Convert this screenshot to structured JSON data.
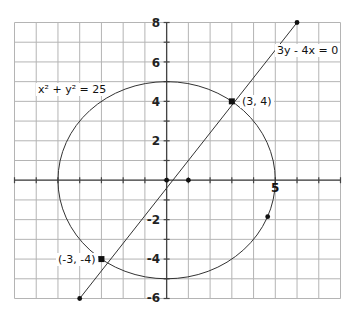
{
  "chart_data": {
    "type": "diagram",
    "title": "",
    "grid": true,
    "xlim": [
      -7,
      8
    ],
    "ylim": [
      -6,
      8
    ],
    "x_grid_step": 1,
    "y_grid_step": 1,
    "y_tick_labels": [
      "8",
      "6",
      "4",
      "2",
      "-2",
      "-4",
      "-6"
    ],
    "y_tick_values": [
      8,
      6,
      4,
      2,
      -2,
      -4,
      -6
    ],
    "x_tick_labels": [
      "5"
    ],
    "x_tick_values": [
      5
    ],
    "curves": [
      {
        "name": "circle",
        "equation": "x² + y² = 25",
        "center": [
          0,
          0
        ],
        "radius": 5
      },
      {
        "name": "line",
        "equation": "3y - 4x = 0",
        "from": [
          -4,
          -6
        ],
        "to": [
          6,
          8
        ]
      }
    ],
    "points": [
      {
        "x": 3,
        "y": 4,
        "label": "(3, 4)"
      },
      {
        "x": -3,
        "y": -4,
        "label": "(-3, -4)"
      },
      {
        "x": 0,
        "y": 0,
        "label": ""
      },
      {
        "x": 1,
        "y": 0,
        "label": ""
      },
      {
        "x": 6,
        "y": 8,
        "label": ""
      },
      {
        "x": -4,
        "y": -6,
        "label": ""
      },
      {
        "x": 4.65,
        "y": -1.85,
        "label": ""
      }
    ]
  },
  "labels": {
    "circle_eq": "x² + y² = 25",
    "line_eq": "3y - 4x = 0",
    "point_a": "(3, 4)",
    "point_b": "(-3, -4)",
    "x5": "5",
    "y8": "8",
    "y6": "6",
    "y4": "4",
    "y2": "2",
    "yn2": "-2",
    "yn4": "-4",
    "yn6": "-6"
  },
  "colors": {
    "grid": "#b4b4b4",
    "axis": "#444444",
    "curve": "#333333",
    "point": "#111111"
  }
}
